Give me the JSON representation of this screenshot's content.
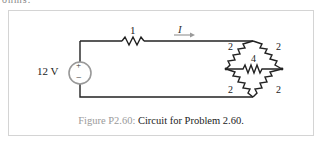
{
  "top_text": "ohms.",
  "diagram": {
    "source_voltage": "12 V",
    "source_plus": "+",
    "source_minus": "−",
    "series_resistor": "1",
    "current_label": "I",
    "bridge": {
      "top_left": "2",
      "top_right": "2",
      "middle": "4",
      "bottom_left": "2",
      "bottom_right": "2"
    }
  },
  "caption": {
    "label": "Figure P2.60:",
    "text": " Circuit for Problem 2.60."
  }
}
